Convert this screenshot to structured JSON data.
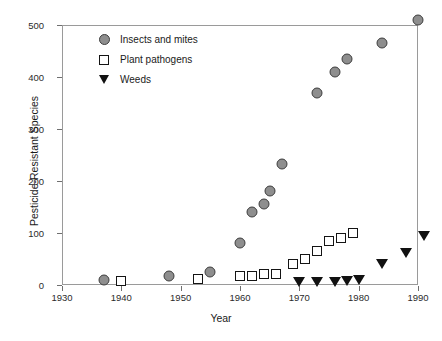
{
  "chart_data": {
    "type": "scatter",
    "title": "",
    "xlabel": "Year",
    "ylabel": "Pesticide-Resistant Species",
    "xlim": [
      1930,
      1992
    ],
    "ylim": [
      0,
      520
    ],
    "xticks": [
      1930,
      1940,
      1950,
      1960,
      1970,
      1980,
      1990
    ],
    "yticks": [
      0,
      100,
      200,
      300,
      400,
      500
    ],
    "grid": false,
    "legend_position": "top-left",
    "series": [
      {
        "name": "Insects and mites",
        "marker": "circle",
        "color": "#8e8e8e",
        "edge_color": "#3d3d3d",
        "points": [
          {
            "x": 1937,
            "y": 10
          },
          {
            "x": 1948,
            "y": 17
          },
          {
            "x": 1955,
            "y": 25
          },
          {
            "x": 1960,
            "y": 80
          },
          {
            "x": 1962,
            "y": 140
          },
          {
            "x": 1964,
            "y": 155
          },
          {
            "x": 1965,
            "y": 180
          },
          {
            "x": 1967,
            "y": 233
          },
          {
            "x": 1973,
            "y": 370
          },
          {
            "x": 1976,
            "y": 410
          },
          {
            "x": 1978,
            "y": 435
          },
          {
            "x": 1984,
            "y": 465
          },
          {
            "x": 1990,
            "y": 510
          }
        ]
      },
      {
        "name": "Plant pathogens",
        "marker": "square",
        "color": "#ffffff",
        "edge_color": "#141414",
        "points": [
          {
            "x": 1940,
            "y": 8
          },
          {
            "x": 1953,
            "y": 12
          },
          {
            "x": 1960,
            "y": 17
          },
          {
            "x": 1962,
            "y": 18
          },
          {
            "x": 1964,
            "y": 22
          },
          {
            "x": 1966,
            "y": 22
          },
          {
            "x": 1969,
            "y": 40
          },
          {
            "x": 1971,
            "y": 50
          },
          {
            "x": 1973,
            "y": 65
          },
          {
            "x": 1975,
            "y": 85
          },
          {
            "x": 1977,
            "y": 90
          },
          {
            "x": 1979,
            "y": 100
          }
        ]
      },
      {
        "name": "Weeds",
        "marker": "triangle-down",
        "color": "#111111",
        "edge_color": "#111111",
        "points": [
          {
            "x": 1970,
            "y": 6
          },
          {
            "x": 1973,
            "y": 6
          },
          {
            "x": 1976,
            "y": 6
          },
          {
            "x": 1978,
            "y": 8
          },
          {
            "x": 1980,
            "y": 9
          },
          {
            "x": 1984,
            "y": 40
          },
          {
            "x": 1988,
            "y": 62
          },
          {
            "x": 1991,
            "y": 95
          }
        ]
      }
    ]
  },
  "legend": {
    "items": [
      {
        "label": "Insects and mites",
        "marker": "circle"
      },
      {
        "label": "Plant pathogens",
        "marker": "square"
      },
      {
        "label": "Weeds",
        "marker": "triangle-down"
      }
    ]
  }
}
